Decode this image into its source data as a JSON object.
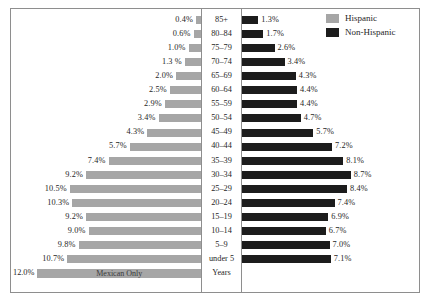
{
  "chart_data": {
    "type": "bar",
    "subtype": "population-pyramid",
    "title": "",
    "xlabel": "",
    "ylabel": "Years",
    "grid": false,
    "legend_position": "top-right",
    "categories": [
      "85+",
      "80–84",
      "75–79",
      "70–74",
      "65–69",
      "60–64",
      "55–59",
      "50–54",
      "45–49",
      "40–44",
      "35–39",
      "30–34",
      "25–29",
      "20–24",
      "15–19",
      "10–14",
      "5–9",
      "under 5"
    ],
    "series": [
      {
        "name": "Hispanic",
        "color": "#a6a6a6",
        "side": "left",
        "values": [
          0.4,
          0.6,
          1.0,
          1.3,
          2.0,
          2.5,
          2.9,
          3.4,
          4.3,
          5.7,
          7.4,
          9.2,
          10.5,
          10.3,
          9.2,
          9.0,
          9.8,
          10.7
        ],
        "labels": [
          "0.4%",
          "0.6%",
          "1.0%",
          "1.3 %",
          "2.0%",
          "2.5%",
          "2.9%",
          "3.4%",
          "4.3%",
          "5.7%",
          "7.4%",
          "9.2%",
          "10.5%",
          "10.3%",
          "9.2%",
          "9.0%",
          "9.8%",
          "10.7%"
        ]
      },
      {
        "name": "Non-Hispanic",
        "color": "#1c1c1c",
        "side": "right",
        "values": [
          1.3,
          1.7,
          2.6,
          3.4,
          4.3,
          4.4,
          4.4,
          4.7,
          5.7,
          7.2,
          8.1,
          8.7,
          8.4,
          7.4,
          6.9,
          6.7,
          7.0,
          7.1
        ],
        "labels": [
          "1.3%",
          "1.7%",
          "2.6%",
          "3.4%",
          "4.3%",
          "4.4%",
          "4.4%",
          "4.7%",
          "5.7%",
          "7.2%",
          "8.1%",
          "8.7%",
          "8.4%",
          "7.4%",
          "6.9%",
          "6.7%",
          "7.0%",
          "7.1%"
        ]
      }
    ],
    "xlim_left": [
      0,
      12.0
    ],
    "xlim_right": [
      0,
      12.0
    ],
    "scale": {
      "value": 12.0,
      "label": "12.0%",
      "bar_label": "Mexican Only",
      "axis_label": "Years"
    }
  },
  "legend": {
    "items": [
      {
        "label": "Hispanic",
        "color": "#a6a6a6"
      },
      {
        "label": "Non-Hispanic",
        "color": "#1c1c1c"
      }
    ]
  }
}
